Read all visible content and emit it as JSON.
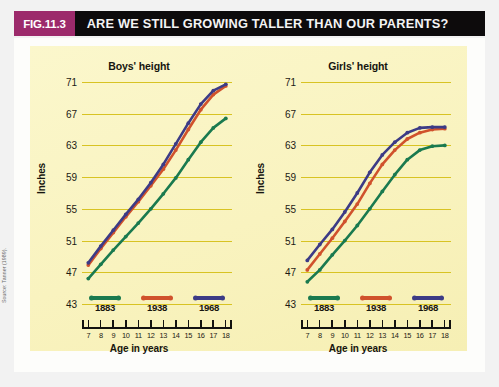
{
  "figure": {
    "badge": "FIG.11.3",
    "title": "ARE WE STILL GROWING TALLER THAN OUR PARENTS?",
    "source": "Source: Tanner (1989)."
  },
  "colors": {
    "badge_bg": "#9c2a6b",
    "titlebar_bg": "#0d0b0c",
    "panel_bg": "#fbf6c8",
    "gridline": "#d8c323",
    "series_1883": "#1a7a4f",
    "series_1938": "#d0522c",
    "series_1968": "#3c3b86"
  },
  "legend": {
    "items": [
      {
        "label": "1883",
        "color": "#1a7a4f"
      },
      {
        "label": "1938",
        "color": "#d0522c"
      },
      {
        "label": "1968",
        "color": "#3c3b86"
      }
    ]
  },
  "axes": {
    "ylabel": "Inches",
    "xlabel": "Age in years",
    "yticks": [
      71,
      67,
      63,
      59,
      55,
      51,
      47,
      43
    ],
    "ylim": [
      43,
      72
    ],
    "xticks": [
      7,
      8,
      9,
      10,
      11,
      12,
      13,
      14,
      15,
      16,
      17,
      18
    ],
    "xlim": [
      6.5,
      18.5
    ]
  },
  "chart_data": [
    {
      "type": "line",
      "title": "Boys' height",
      "xlabel": "Age in years",
      "ylabel": "Inches",
      "ylim": [
        43,
        72
      ],
      "xlim": [
        6.5,
        18.5
      ],
      "grid": true,
      "legend_position": "bottom",
      "x": [
        7,
        8,
        9,
        10,
        11,
        12,
        13,
        14,
        15,
        16,
        17,
        18
      ],
      "series": [
        {
          "name": "1883",
          "color": "#1a7a4f",
          "values": [
            46.2,
            48.0,
            49.8,
            51.5,
            53.2,
            55.0,
            56.9,
            58.9,
            61.2,
            63.4,
            65.2,
            66.4
          ]
        },
        {
          "name": "1938",
          "color": "#d0522c",
          "values": [
            47.9,
            50.0,
            52.0,
            54.0,
            55.9,
            57.9,
            60.0,
            62.4,
            65.0,
            67.5,
            69.4,
            70.5
          ]
        },
        {
          "name": "1968",
          "color": "#3c3b86",
          "values": [
            48.2,
            50.3,
            52.3,
            54.3,
            56.2,
            58.3,
            60.6,
            63.2,
            65.8,
            68.2,
            69.9,
            70.7
          ]
        }
      ]
    },
    {
      "type": "line",
      "title": "Girls' height",
      "xlabel": "Age in years",
      "ylabel": "Inches",
      "ylim": [
        43,
        72
      ],
      "xlim": [
        6.5,
        18.5
      ],
      "grid": true,
      "legend_position": "bottom",
      "x": [
        7,
        8,
        9,
        10,
        11,
        12,
        13,
        14,
        15,
        16,
        17,
        18
      ],
      "series": [
        {
          "name": "1883",
          "color": "#1a7a4f",
          "values": [
            45.8,
            47.3,
            49.2,
            51.0,
            52.9,
            55.0,
            57.2,
            59.3,
            61.2,
            62.4,
            62.9,
            63.0
          ]
        },
        {
          "name": "1938",
          "color": "#d0522c",
          "values": [
            47.3,
            49.3,
            51.3,
            53.4,
            55.6,
            58.2,
            60.6,
            62.4,
            63.8,
            64.6,
            65.0,
            65.1
          ]
        },
        {
          "name": "1968",
          "color": "#3c3b86",
          "values": [
            48.5,
            50.5,
            52.4,
            54.6,
            57.0,
            59.6,
            61.8,
            63.4,
            64.6,
            65.2,
            65.3,
            65.3
          ]
        }
      ]
    }
  ]
}
